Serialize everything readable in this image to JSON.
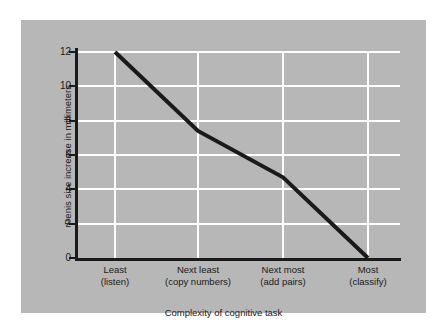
{
  "chart_data": {
    "type": "line",
    "title": "",
    "xlabel": "Complexity of cognitive task",
    "ylabel": "Penis size increase in millimeters",
    "categories": [
      {
        "line1": "Least",
        "line2": "(listen)"
      },
      {
        "line1": "Next least",
        "line2": "(copy numbers)"
      },
      {
        "line1": "Next most",
        "line2": "(add pairs)"
      },
      {
        "line1": "Most",
        "line2": "(classify)"
      }
    ],
    "category_labels": [
      "Least (listen)",
      "Next least (copy numbers)",
      "Next most (add pairs)",
      "Most (classify)"
    ],
    "values": [
      12.0,
      7.4,
      4.7,
      0.0
    ],
    "series": [
      {
        "name": "Penis size increase",
        "values": [
          12.0,
          7.4,
          4.7,
          0.0
        ]
      }
    ],
    "ylim": [
      0,
      12
    ],
    "yticks": [
      "0",
      "2",
      "4",
      "6",
      "8",
      "10",
      "12"
    ],
    "ytick_values": [
      0,
      2,
      4,
      6,
      8,
      10,
      12
    ],
    "grid": true,
    "legend": "none",
    "line_color": "#1a1a1a",
    "grid_color": "#ffffff",
    "panel_color": "#b7b7b7",
    "axis_color": "#1a1a1a"
  }
}
